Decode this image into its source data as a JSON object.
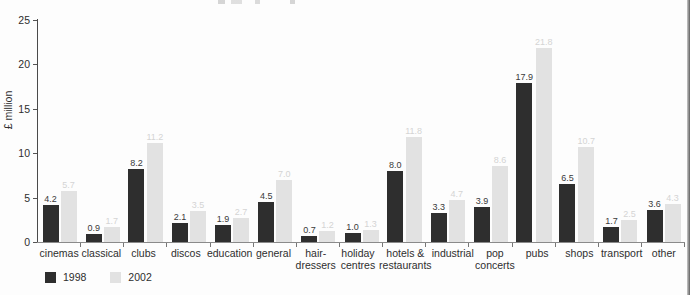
{
  "chart_data": {
    "type": "bar",
    "title": "",
    "xlabel": "",
    "ylabel": "£ million",
    "ylim": [
      0,
      25
    ],
    "yticks": [
      0,
      5,
      10,
      15,
      20,
      25
    ],
    "grid": false,
    "legend_position": "bottom-left",
    "categories": [
      "cinemas",
      "classical",
      "clubs",
      "discos",
      "education",
      "general",
      "hair-\ndressers",
      "holiday\ncentres",
      "hotels &\nrestaurants",
      "industrial",
      "pop\nconcerts",
      "pubs",
      "shops",
      "transport",
      "other"
    ],
    "series": [
      {
        "name": "1998",
        "color": "#2e2e2e",
        "label_color": "#3a3a3a",
        "values": [
          4.2,
          0.9,
          8.2,
          2.1,
          1.9,
          4.5,
          0.7,
          1.0,
          8.0,
          3.3,
          3.9,
          17.9,
          6.5,
          1.7,
          3.6
        ]
      },
      {
        "name": "2002",
        "color": "#e2e2e2",
        "label_color": "#d4d4d4",
        "values": [
          5.7,
          1.7,
          11.2,
          3.5,
          2.7,
          7.0,
          1.2,
          1.3,
          11.8,
          4.7,
          8.6,
          21.8,
          10.7,
          2.5,
          4.3
        ]
      }
    ]
  },
  "legend": {
    "series_1998_label": "1998",
    "series_2002_label": "2002"
  },
  "axes": {
    "y_title": "£ million"
  }
}
